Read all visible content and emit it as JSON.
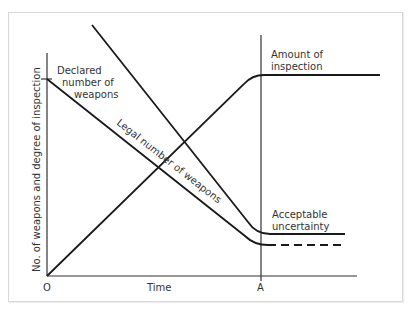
{
  "diagram": {
    "axes": {
      "y_label": "No. of weapons and degree of inspection",
      "x_label": "Time",
      "origin_label": "O",
      "marker_label": "A"
    },
    "curves": [
      {
        "id": "declared",
        "label": "Declared number of weapons",
        "label_lines": [
          "Declared",
          "number of",
          "weapons"
        ],
        "style": "solid"
      },
      {
        "id": "legal",
        "label": "Legal number of weapons",
        "style": "solid"
      },
      {
        "id": "inspection",
        "label": "Amount of inspection",
        "label_lines": [
          "Amount of",
          "inspection"
        ],
        "style": "solid"
      },
      {
        "id": "uncertainty",
        "label": "Acceptable uncertainty",
        "label_lines": [
          "Acceptable",
          "uncertainty"
        ],
        "style": "dashed"
      }
    ],
    "colors": {
      "line": "#1a1a1a",
      "text": "#333333",
      "frame": "#d8d8d8"
    }
  }
}
